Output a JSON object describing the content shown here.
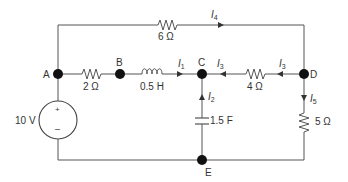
{
  "diagram": {
    "type": "electrical-circuit",
    "nodes": [
      {
        "id": "A",
        "label": "A"
      },
      {
        "id": "B",
        "label": "B"
      },
      {
        "id": "C",
        "label": "C"
      },
      {
        "id": "D",
        "label": "D"
      },
      {
        "id": "E",
        "label": "E"
      }
    ],
    "components": {
      "r_top": {
        "label": "6 Ω",
        "kind": "resistor",
        "between": "A-D (top branch)"
      },
      "r_ab": {
        "label": "2 Ω",
        "kind": "resistor",
        "between": "A-B"
      },
      "l_bc": {
        "label": "0.5 H",
        "kind": "inductor",
        "between": "B-C"
      },
      "r_dc": {
        "label": "4 Ω",
        "kind": "resistor",
        "between": "D-C"
      },
      "c_ce": {
        "label": "1.5 F",
        "kind": "capacitor",
        "between": "C-E"
      },
      "r_de": {
        "label": "5 Ω",
        "kind": "resistor",
        "between": "D-E"
      },
      "v_src": {
        "label": "10 V",
        "kind": "voltage-source",
        "between": "A-E",
        "plus": "+",
        "minus": "–"
      }
    },
    "currents": {
      "i1": {
        "symbol": "I",
        "sub": "1",
        "direction": "B→C"
      },
      "i2": {
        "symbol": "I",
        "sub": "2",
        "direction": "E→C"
      },
      "i3a": {
        "symbol": "I",
        "sub": "3",
        "direction": "D→C (near C)"
      },
      "i3b": {
        "symbol": "I",
        "sub": "3",
        "direction": "D→C (near D)"
      },
      "i4": {
        "symbol": "I",
        "sub": "4",
        "direction": "A→D (top)"
      },
      "i5": {
        "symbol": "I",
        "sub": "5",
        "direction": "D→E"
      }
    }
  }
}
